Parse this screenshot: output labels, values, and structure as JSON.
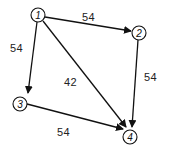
{
  "diagram": {
    "type": "directed-weighted-graph",
    "nodes": [
      {
        "id": "1",
        "label": "1"
      },
      {
        "id": "2",
        "label": "2"
      },
      {
        "id": "3",
        "label": "3"
      },
      {
        "id": "4",
        "label": "4"
      }
    ],
    "edges": [
      {
        "from": "1",
        "to": "2",
        "weight": "54"
      },
      {
        "from": "1",
        "to": "3",
        "weight": "54"
      },
      {
        "from": "1",
        "to": "4",
        "weight": "42"
      },
      {
        "from": "2",
        "to": "4",
        "weight": "54"
      },
      {
        "from": "3",
        "to": "4",
        "weight": "54"
      }
    ],
    "colors": {
      "stroke": "#111111",
      "background": "#ffffff"
    }
  }
}
